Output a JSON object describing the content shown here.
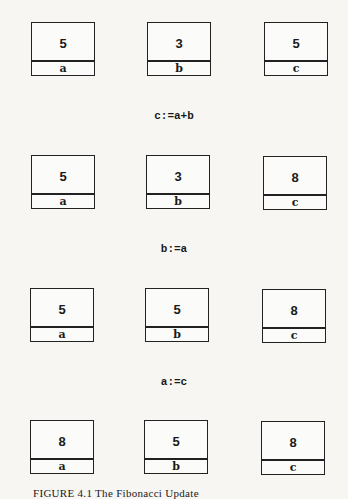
{
  "states": [
    {
      "cells": [
        {
          "name": "a",
          "value": "5"
        },
        {
          "name": "b",
          "value": "3"
        },
        {
          "name": "c",
          "value": "5"
        }
      ]
    },
    {
      "cells": [
        {
          "name": "a",
          "value": "5"
        },
        {
          "name": "b",
          "value": "3"
        },
        {
          "name": "c",
          "value": "8"
        }
      ]
    },
    {
      "cells": [
        {
          "name": "a",
          "value": "5"
        },
        {
          "name": "b",
          "value": "5"
        },
        {
          "name": "c",
          "value": "8"
        }
      ]
    },
    {
      "cells": [
        {
          "name": "a",
          "value": "8"
        },
        {
          "name": "b",
          "value": "5"
        },
        {
          "name": "c",
          "value": "8"
        }
      ]
    }
  ],
  "statements": [
    "c:=a+b",
    "b:=a",
    "a:=c"
  ],
  "caption": "FIGURE 4.1 The Fibonacci Update"
}
